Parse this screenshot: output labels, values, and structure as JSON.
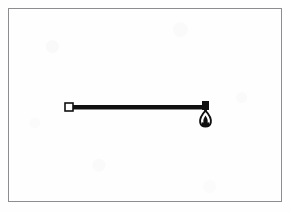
{
  "document": {
    "kind": "scanned-figure",
    "page_background": "#fefefe",
    "frame": {
      "border_color": "#8d8d90",
      "border_width_px": 1,
      "x": 8,
      "y": 8,
      "width": 274,
      "height": 194
    }
  },
  "figure": {
    "title": "",
    "caption": "",
    "ink_color": "#101010",
    "fill_white": "#ffffff",
    "elements": {
      "beam": {
        "label": "horizontal-beam",
        "x1": 70,
        "y1": 107,
        "x2": 205,
        "y2": 107,
        "thickness_px": 4
      },
      "left_support": {
        "label": "hollow-square-pivot",
        "cx": 69,
        "cy": 107,
        "size_px": 8,
        "fill": "#ffffff",
        "stroke": "#101010"
      },
      "right_block": {
        "label": "solid-block",
        "x": 202,
        "y": 101,
        "width": 7,
        "height": 9,
        "fill": "#101010"
      },
      "pendant": {
        "label": "hanging-bob",
        "cx": 205,
        "top_y": 110,
        "bottom_y": 126,
        "width_px": 11,
        "outline": "#101010",
        "inner_fill": "#ffffff",
        "core_fill": "#101010"
      }
    }
  }
}
